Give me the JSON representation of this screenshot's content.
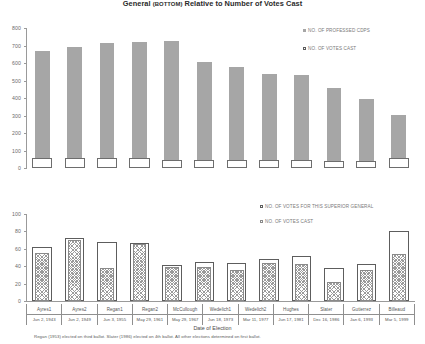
{
  "title": {
    "main_prefix": "General ",
    "main_small": "(BOTTOM)",
    "main_suffix": " Relative to Number of Votes Cast"
  },
  "top_legend": [
    {
      "label": "NO. OF PROFESSED CDPS",
      "marker": "gray-square"
    },
    {
      "label": "NO. OF VOTES CAST",
      "marker": "open-square"
    }
  ],
  "bottom_legend": [
    {
      "label": "NO. OF VOTES FOR THIS SUPERIOR GENERAL",
      "marker": "open-square"
    },
    {
      "label": "NO. OF VOTES CAST",
      "marker": "hatched-square"
    }
  ],
  "xaxis_title": "Date of Election",
  "footnote": "Regan (1953) elected on third ballot. Slater (1986) elected on 4th ballot. All other elections determined on first ballot.",
  "categories": [
    {
      "name": "Ayres1",
      "date": "Jun 2, 1943"
    },
    {
      "name": "Ayres2",
      "date": "Jun 2, 1949"
    },
    {
      "name": "Regan1",
      "date": "Jun 3, 1955"
    },
    {
      "name": "Regan2",
      "date": "May 29, 1961"
    },
    {
      "name": "McCullough",
      "date": "May 29, 1967"
    },
    {
      "name": "Wedelich1",
      "date": "Jun 18, 1973"
    },
    {
      "name": "Wedelich2",
      "date": "Mar 11, 1977"
    },
    {
      "name": "Hughes",
      "date": "Jun 17, 1981"
    },
    {
      "name": "Slater",
      "date": "Dec 16, 1986"
    },
    {
      "name": "Gutierrez",
      "date": "Jan 6, 1993"
    },
    {
      "name": "Billeaud",
      "date": "Mar 5, 1999"
    }
  ],
  "chart_data": [
    {
      "type": "bar",
      "id": "top",
      "title": "Number of Professed CDPs and Number of Votes Cast",
      "xlabel": "",
      "ylabel": "",
      "ylim": [
        0,
        800
      ],
      "yticks": [
        0,
        100,
        200,
        300,
        400,
        500,
        600,
        700,
        800
      ],
      "grid": false,
      "legend_position": "right",
      "categories": [
        "Ayres1",
        "Ayres2",
        "Regan1",
        "Regan2",
        "McCullough",
        "Wedelich1",
        "Wedelich2",
        "Hughes",
        "Slater",
        "Gutierrez",
        "Billeaud"
      ],
      "series": [
        {
          "name": "NO. OF PROFESSED CDPS",
          "values": [
            670,
            692,
            712,
            718,
            728,
            608,
            578,
            540,
            530,
            460,
            395,
            305
          ]
        },
        {
          "name": "NO. OF VOTES CAST",
          "values": [
            58,
            58,
            56,
            56,
            46,
            44,
            44,
            44,
            44,
            42,
            42,
            60
          ]
        }
      ]
    },
    {
      "type": "bar",
      "id": "bottom",
      "title": "Votes for Superior General Relative to Number of Votes Cast",
      "xlabel": "Date of Election",
      "ylabel": "",
      "ylim": [
        0,
        100
      ],
      "yticks": [
        0,
        20,
        40,
        60,
        80,
        100
      ],
      "grid": false,
      "legend_position": "right",
      "categories": [
        "Ayres1",
        "Ayres2",
        "Regan1",
        "Regan2",
        "McCullough",
        "Wedelich1",
        "Wedelich2",
        "Hughes",
        "Slater",
        "Gutierrez",
        "Billeaud"
      ],
      "series": [
        {
          "name": "NO. OF VOTES CAST",
          "values": [
            62,
            72,
            68,
            67,
            41,
            45,
            44,
            48,
            52,
            38,
            42,
            80
          ]
        },
        {
          "name": "NO. OF VOTES FOR THIS SUPERIOR GENERAL",
          "values": [
            55,
            70,
            38,
            65,
            39,
            39,
            36,
            44,
            42,
            22,
            36,
            54
          ]
        }
      ]
    }
  ]
}
